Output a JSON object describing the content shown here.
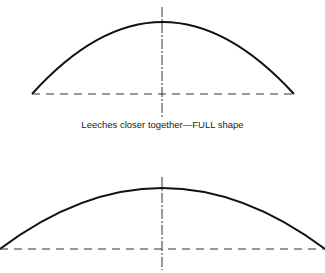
{
  "figure": {
    "caption_top": "Leeches closer together—FULL shape",
    "colors": {
      "stroke": "#111111",
      "background": "#ffffff"
    },
    "shapes": [
      {
        "name": "full-shape",
        "left": [
          32,
          94
        ],
        "right": [
          294,
          94
        ],
        "apex": [
          162,
          22
        ],
        "axis": [
          162,
          7,
          118
        ]
      },
      {
        "name": "flat-shape",
        "left": [
          0,
          249
        ],
        "right": [
          325,
          249
        ],
        "apex": [
          162,
          188
        ],
        "axis": [
          162,
          177,
          270
        ]
      }
    ]
  }
}
